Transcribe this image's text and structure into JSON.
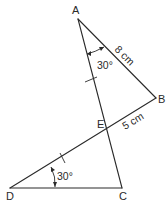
{
  "diagram": {
    "vertices": {
      "A": {
        "label": "A"
      },
      "B": {
        "label": "B"
      },
      "C": {
        "label": "C"
      },
      "D": {
        "label": "D"
      },
      "E": {
        "label": "E"
      }
    },
    "segments": [
      "AC",
      "AB",
      "BD",
      "DC"
    ],
    "measurements": {
      "AB": "8 cm",
      "EB": "5 cm"
    },
    "angles": {
      "BAE": "30°",
      "EDC": "30°"
    },
    "equal_marks": [
      "AE",
      "DE"
    ],
    "color": "#2a2a2a"
  }
}
